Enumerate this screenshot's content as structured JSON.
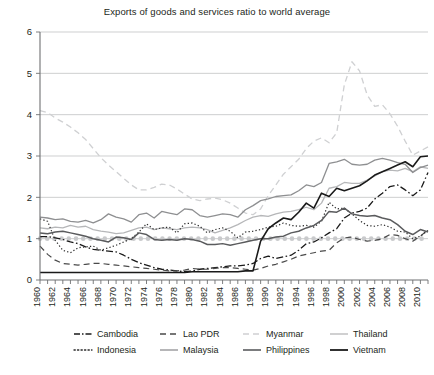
{
  "chart_data": {
    "type": "line",
    "title": "Exports of goods and services ratio to world average",
    "xlabel": "",
    "ylabel": "",
    "xlim": [
      1960,
      2011
    ],
    "ylim": [
      0,
      6
    ],
    "yticks": [
      0,
      1,
      2,
      3,
      4,
      5,
      6
    ],
    "ytick_labels": [
      "0",
      "1",
      "2",
      "3",
      "4",
      "5",
      "6"
    ],
    "grid": "horizontal",
    "legend_position": "bottom",
    "xticks": [
      1960,
      1962,
      1964,
      1966,
      1968,
      1970,
      1972,
      1974,
      1976,
      1978,
      1980,
      1982,
      1984,
      1986,
      1988,
      1990,
      1992,
      1994,
      1996,
      1998,
      2000,
      2002,
      2004,
      2006,
      2008,
      2010
    ],
    "xtick_labels": [
      "1960",
      "1962",
      "1964",
      "1966",
      "1968",
      "1970",
      "1972",
      "1974",
      "1976",
      "1978",
      "1980",
      "1982",
      "1984",
      "1986",
      "1988",
      "1990",
      "1992",
      "1994",
      "1996",
      "1998",
      "2000",
      "2002",
      "2004",
      "2006",
      "2008",
      "2010"
    ],
    "x": [
      1960,
      1961,
      1962,
      1963,
      1964,
      1965,
      1966,
      1967,
      1968,
      1969,
      1970,
      1971,
      1972,
      1973,
      1974,
      1975,
      1976,
      1977,
      1978,
      1979,
      1980,
      1981,
      1982,
      1983,
      1984,
      1985,
      1986,
      1987,
      1988,
      1989,
      1990,
      1991,
      1992,
      1993,
      1994,
      1995,
      1996,
      1997,
      1998,
      1999,
      2000,
      2001,
      2002,
      2003,
      2004,
      2005,
      2006,
      2007,
      2008,
      2009,
      2010,
      2011
    ],
    "series": [
      {
        "name": "Cambodia",
        "style": "dashdot",
        "color": "#1a1a1a",
        "width": 1.3,
        "dash": "7,2.5,1.6,2.5",
        "values": [
          1.05,
          1.05,
          1.02,
          0.98,
          0.92,
          0.88,
          0.8,
          0.74,
          0.72,
          0.7,
          0.68,
          0.6,
          0.5,
          0.42,
          0.36,
          0.3,
          0.26,
          0.24,
          0.22,
          0.2,
          0.22,
          0.26,
          0.28,
          0.3,
          0.32,
          0.34,
          0.34,
          0.36,
          0.4,
          0.52,
          0.58,
          0.52,
          0.56,
          0.6,
          0.72,
          0.88,
          0.92,
          1.02,
          1.14,
          1.24,
          1.5,
          1.62,
          1.66,
          1.74,
          1.96,
          2.1,
          2.26,
          2.3,
          2.18,
          2.04,
          2.18,
          2.6
        ]
      },
      {
        "name": "Lao PDR",
        "style": "dashed",
        "color": "#4a4a4a",
        "width": 1.2,
        "dash": "6,4",
        "values": [
          0.82,
          0.62,
          0.48,
          0.4,
          0.38,
          0.36,
          0.38,
          0.4,
          0.4,
          0.38,
          0.36,
          0.34,
          0.32,
          0.3,
          0.28,
          0.26,
          0.24,
          0.22,
          0.22,
          0.24,
          0.28,
          0.26,
          0.26,
          0.28,
          0.3,
          0.3,
          0.28,
          0.26,
          0.24,
          0.28,
          0.34,
          0.38,
          0.44,
          0.5,
          0.58,
          0.62,
          0.66,
          0.7,
          0.72,
          0.9,
          1.02,
          1.04,
          0.98,
          0.94,
          0.96,
          1.0,
          1.1,
          1.08,
          1.0,
          0.94,
          1.06,
          1.22
        ]
      },
      {
        "name": "Myanmar",
        "style": "dashed-light",
        "color": "#cfd0d2",
        "width": 1.3,
        "dash": "6,4",
        "values": [
          4.1,
          4.05,
          3.92,
          3.82,
          3.7,
          3.56,
          3.4,
          3.18,
          2.96,
          2.78,
          2.62,
          2.46,
          2.3,
          2.18,
          2.18,
          2.24,
          2.32,
          2.3,
          2.2,
          2.08,
          1.96,
          1.92,
          1.96,
          1.98,
          1.94,
          1.86,
          1.74,
          1.62,
          1.58,
          1.72,
          2.04,
          2.3,
          2.56,
          2.74,
          2.92,
          3.18,
          3.36,
          3.44,
          3.32,
          3.56,
          4.72,
          5.28,
          5.06,
          4.48,
          4.2,
          4.24,
          4.02,
          3.72,
          3.36,
          3.02,
          3.12,
          3.22
        ]
      },
      {
        "name": "Thailand",
        "style": "solid-light",
        "color": "#b6b7b9",
        "width": 1.3,
        "dash": "",
        "values": [
          1.26,
          1.24,
          1.28,
          1.26,
          1.32,
          1.28,
          1.3,
          1.22,
          1.18,
          1.16,
          1.12,
          1.14,
          1.2,
          1.26,
          1.28,
          1.22,
          1.26,
          1.24,
          1.22,
          1.26,
          1.28,
          1.26,
          1.22,
          1.14,
          1.2,
          1.26,
          1.34,
          1.44,
          1.52,
          1.56,
          1.54,
          1.6,
          1.64,
          1.66,
          1.7,
          1.76,
          1.7,
          1.86,
          2.22,
          2.26,
          2.36,
          2.34,
          2.34,
          2.42,
          2.52,
          2.62,
          2.66,
          2.64,
          2.7,
          2.62,
          2.74,
          2.7
        ]
      },
      {
        "name": "Indonesia",
        "style": "dotted",
        "color": "#2b2b2b",
        "width": 1.2,
        "dash": "1.3,2.2",
        "values": [
          1.48,
          1.42,
          0.96,
          0.72,
          0.66,
          0.78,
          0.8,
          0.82,
          0.72,
          0.78,
          0.84,
          0.92,
          1.0,
          1.16,
          1.36,
          1.22,
          1.26,
          1.28,
          1.14,
          1.36,
          1.38,
          1.3,
          1.14,
          1.22,
          1.26,
          1.18,
          1.02,
          1.16,
          1.18,
          1.22,
          1.28,
          1.3,
          1.38,
          1.32,
          1.3,
          1.32,
          1.28,
          1.42,
          1.88,
          1.72,
          1.74,
          1.6,
          1.44,
          1.32,
          1.3,
          1.34,
          1.28,
          1.18,
          1.16,
          1.0,
          1.06,
          1.2
        ]
      },
      {
        "name": "Malaysia",
        "style": "solid-mid",
        "color": "#8e8f91",
        "width": 1.3,
        "dash": "",
        "values": [
          1.52,
          1.5,
          1.46,
          1.48,
          1.42,
          1.4,
          1.44,
          1.38,
          1.46,
          1.6,
          1.52,
          1.48,
          1.4,
          1.58,
          1.62,
          1.5,
          1.66,
          1.62,
          1.58,
          1.72,
          1.7,
          1.56,
          1.52,
          1.56,
          1.6,
          1.58,
          1.52,
          1.7,
          1.8,
          1.92,
          1.96,
          2.02,
          2.04,
          2.06,
          2.16,
          2.3,
          2.26,
          2.36,
          2.82,
          2.86,
          2.92,
          2.8,
          2.78,
          2.8,
          2.9,
          2.94,
          2.9,
          2.84,
          2.8,
          2.6,
          2.72,
          2.78
        ]
      },
      {
        "name": "Philippines",
        "style": "solid-dark",
        "color": "#5a5b5d",
        "width": 1.5,
        "dash": "",
        "values": [
          1.14,
          1.12,
          1.16,
          1.18,
          1.14,
          1.1,
          1.06,
          1.0,
          0.96,
          0.92,
          1.04,
          1.02,
          0.98,
          1.14,
          1.1,
          0.98,
          0.96,
          0.98,
          0.96,
          1.0,
          0.98,
          0.94,
          0.86,
          0.86,
          0.88,
          0.84,
          0.88,
          0.92,
          0.96,
          1.0,
          1.0,
          1.04,
          1.06,
          1.14,
          1.18,
          1.26,
          1.32,
          1.44,
          1.66,
          1.64,
          1.74,
          1.6,
          1.56,
          1.54,
          1.56,
          1.5,
          1.46,
          1.34,
          1.18,
          1.1,
          1.22,
          1.16
        ]
      },
      {
        "name": "Vietnam",
        "style": "solid-black",
        "color": "#1a1a1a",
        "width": 1.6,
        "dash": "",
        "values": [
          0.18,
          0.18,
          0.18,
          0.18,
          0.18,
          0.18,
          0.18,
          0.18,
          0.18,
          0.18,
          0.18,
          0.18,
          0.18,
          0.18,
          0.18,
          0.18,
          0.18,
          0.18,
          0.18,
          0.18,
          0.2,
          0.2,
          0.2,
          0.2,
          0.2,
          0.2,
          0.2,
          0.22,
          0.22,
          0.94,
          1.24,
          1.38,
          1.5,
          1.46,
          1.64,
          1.86,
          1.74,
          2.1,
          2.02,
          2.22,
          2.16,
          2.22,
          2.28,
          2.4,
          2.54,
          2.62,
          2.7,
          2.78,
          2.86,
          2.74,
          2.98,
          3.0
        ]
      }
    ],
    "reference_band": {
      "name": "world-average-band",
      "value": 1.0,
      "color": "#c9cacc"
    }
  },
  "legend": {
    "row1": [
      {
        "label": "Cambodia",
        "swatch": "dashdot",
        "color": "#1a1a1a"
      },
      {
        "label": "Lao PDR",
        "swatch": "dashed",
        "color": "#4a4a4a"
      },
      {
        "label": "Myanmar",
        "swatch": "dashed-light",
        "color": "#cfd0d2"
      },
      {
        "label": "Thailand",
        "swatch": "solid-light",
        "color": "#b6b7b9"
      }
    ],
    "row2": [
      {
        "label": "Indonesia",
        "swatch": "dotted",
        "color": "#2b2b2b"
      },
      {
        "label": "Malaysia",
        "swatch": "solid-mid",
        "color": "#8e8f91"
      },
      {
        "label": "Philippines",
        "swatch": "solid-dark",
        "color": "#5a5b5d"
      },
      {
        "label": "Vietnam",
        "swatch": "solid-black",
        "color": "#1a1a1a"
      }
    ]
  }
}
